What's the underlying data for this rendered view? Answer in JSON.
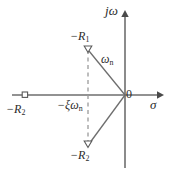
{
  "figure": {
    "background_color": "#ffffff",
    "line_color": "#4a4a4a",
    "text_color": "#2b2b2b",
    "dashed_color": "#8a8a8a"
  },
  "axes": {
    "imaginary": {
      "label": "jω",
      "label_plain": "j-omega",
      "orientation": "vertical",
      "arrow": "up",
      "x": 125,
      "y_top": 12,
      "y_bottom": 168
    },
    "real": {
      "label": "σ",
      "label_plain": "sigma",
      "orientation": "horizontal",
      "arrow": "right",
      "y": 95,
      "x_left": 12,
      "x_right": 160
    },
    "origin": {
      "label": "0",
      "x": 125,
      "y": 95
    }
  },
  "markers": [
    {
      "name": "pole-upper-conjugate",
      "label": "-R₁",
      "label_base": "−R",
      "label_sub": "1",
      "shape": "open-triangle-down",
      "x": 88,
      "y": 50
    },
    {
      "name": "pole-lower-conjugate",
      "label": "-R₂",
      "label_base": "−R",
      "label_sub": "2",
      "shape": "open-triangle-down",
      "x": 88,
      "y": 145
    },
    {
      "name": "pole-real-axis",
      "label": "-R₂",
      "label_base": "−R",
      "label_sub": "2",
      "shape": "open-square",
      "x": 25,
      "y": 95
    }
  ],
  "annotations": {
    "natural_frequency": {
      "label": "ωₙ",
      "label_base": "ω",
      "label_sub": "n",
      "description": "radius from origin to complex pole"
    },
    "damping_projection": {
      "label": "-ξωₙ",
      "label_base": "−ξω",
      "label_sub": "n",
      "description": "real-part projection of complex pole pair"
    }
  },
  "lines": {
    "radius_upper": {
      "from": [
        125,
        95
      ],
      "to": [
        88,
        50
      ],
      "style": "solid"
    },
    "radius_lower": {
      "from": [
        125,
        95
      ],
      "to": [
        88,
        145
      ],
      "style": "solid"
    },
    "dashed_vertical": {
      "from": [
        88,
        50
      ],
      "to": [
        88,
        145
      ],
      "style": "dashed"
    }
  }
}
